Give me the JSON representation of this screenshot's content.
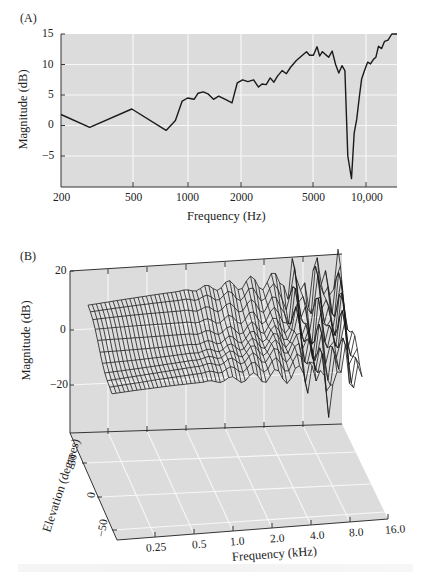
{
  "figure": {
    "panel_a": {
      "label": "(A)",
      "ylabel": "Magnitude (dB)",
      "xlabel": "Frequency (Hz)",
      "yticks": [
        "15",
        "10",
        "5",
        "0",
        "−5"
      ],
      "xticks": [
        "200",
        "500",
        "1000",
        "2000",
        "5000",
        "10,000"
      ]
    },
    "panel_b": {
      "label": "(B)",
      "zlabel": "Magnitude (dB)",
      "ylabel": "Elevation (degrees)",
      "xlabel": "Frequency (kHz)",
      "zticks": [
        "20",
        "0",
        "−20"
      ],
      "yticks": [
        "50",
        "0",
        "−50"
      ],
      "xticks": [
        "0.25",
        "0.5",
        "1.0",
        "2.0",
        "4.0",
        "8.0",
        "16.0"
      ]
    }
  },
  "colors": {
    "plot_bg": "#dcdcdc",
    "grid": "#f7f7f7",
    "line": "#1a1a1a",
    "axis": "#333333"
  },
  "chart_data": [
    {
      "type": "line",
      "title": "(A)",
      "xlabel": "Frequency (Hz)",
      "ylabel": "Magnitude (dB)",
      "xscale": "log",
      "xlim": [
        200,
        15500
      ],
      "ylim": [
        -10,
        15
      ],
      "grid": true,
      "xticks": [
        200,
        500,
        1000,
        2000,
        5000,
        10000
      ],
      "yticks": [
        15,
        10,
        5,
        0,
        -5
      ],
      "series": [
        {
          "name": "Magnitude",
          "x": [
            200,
            290,
            500,
            780,
            880,
            960,
            1030,
            1120,
            1180,
            1260,
            1340,
            1440,
            1540,
            1700,
            1830,
            1960,
            2100,
            2250,
            2420,
            2580,
            2700,
            2850,
            3000,
            3150,
            3300,
            3500,
            3700,
            3900,
            4200,
            4500,
            4800,
            5000,
            5250,
            5500,
            5700,
            5900,
            6100,
            6400,
            6700,
            7000,
            7300,
            7600,
            7900,
            8200,
            8600,
            8900,
            9200,
            9500,
            9800,
            10200,
            10600,
            11000,
            11400,
            11800,
            12200,
            12700,
            13200,
            13800,
            14500,
            15500
          ],
          "y": [
            1.8,
            -0.3,
            2.7,
            -0.8,
            0.8,
            4.0,
            4.5,
            4.3,
            5.3,
            5.5,
            5.2,
            4.3,
            4.8,
            4.2,
            3.7,
            7.0,
            7.5,
            7.2,
            7.5,
            6.3,
            6.8,
            6.7,
            7.8,
            7.1,
            8.1,
            9.0,
            8.5,
            9.5,
            10.6,
            11.4,
            12.1,
            11.5,
            11.5,
            12.9,
            11.4,
            12.1,
            11.7,
            11.2,
            12.2,
            10.0,
            8.6,
            9.8,
            9.0,
            -5.0,
            -8.7,
            -1.2,
            1.0,
            4.5,
            7.6,
            9.1,
            10.4,
            10.1,
            10.8,
            11.2,
            13.0,
            12.6,
            13.8,
            14.0,
            15.0,
            15.3
          ]
        }
      ]
    },
    {
      "type": "surface",
      "title": "(B)",
      "xlabel": "Frequency (kHz)",
      "ylabel": "Elevation (degrees)",
      "zlabel": "Magnitude (dB)",
      "xscale": "log",
      "xticks": [
        0.25,
        0.5,
        1.0,
        2.0,
        4.0,
        8.0,
        16.0
      ],
      "yticks": [
        50,
        0,
        -50
      ],
      "zticks": [
        20,
        0,
        -20
      ],
      "xlim": [
        0.2,
        16.0
      ],
      "ylim": [
        -50,
        90
      ],
      "zlim": [
        -40,
        20
      ],
      "grid": true,
      "description": "Wireframe HRTF magnitude surface vs. frequency and elevation; smooth near -5 to -25 dB at low frequency, increasingly rippled above 4 kHz with deep notches near 8-10 kHz"
    }
  ]
}
